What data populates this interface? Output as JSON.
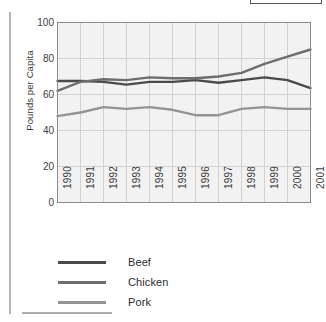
{
  "chart_data": {
    "type": "line",
    "title": "",
    "xlabel": "",
    "ylabel": "Pounds per Capita",
    "x": [
      "1990",
      "1991",
      "1992",
      "1993",
      "1994",
      "1995",
      "1996",
      "1997",
      "1998",
      "1999",
      "2000",
      "2001"
    ],
    "categories": [
      "1990",
      "1991",
      "1992",
      "1993",
      "1994",
      "1995",
      "1996",
      "1997",
      "1998",
      "1999",
      "2000",
      "2001"
    ],
    "ylim": [
      0,
      100
    ],
    "yticks": [
      0,
      20,
      40,
      60,
      80,
      100
    ],
    "ytick_labels": [
      "0",
      "20",
      "40",
      "60",
      "80",
      "100"
    ],
    "grid": true,
    "legend_position": "below",
    "series": [
      {
        "name": "Beef",
        "color": "#4a4a4a",
        "values": [
          67.5,
          67.5,
          67.0,
          65.5,
          67.0,
          67.0,
          68.0,
          66.5,
          68.0,
          69.5,
          68.0,
          63.5
        ]
      },
      {
        "name": "Chicken",
        "color": "#6e6e6e",
        "values": [
          62.0,
          67.0,
          68.5,
          68.0,
          69.5,
          69.0,
          69.0,
          70.0,
          72.0,
          77.0,
          81.0,
          85.0
        ]
      },
      {
        "name": "Pork",
        "color": "#949494",
        "values": [
          48.0,
          50.0,
          53.0,
          52.0,
          53.0,
          51.5,
          48.5,
          48.5,
          52.0,
          53.0,
          52.0,
          52.0
        ]
      }
    ]
  },
  "legend": {
    "items": [
      {
        "label": "Beef"
      },
      {
        "label": "Chicken"
      },
      {
        "label": "Pork"
      }
    ]
  },
  "axes": {
    "y_title": "Pounds per Capita"
  },
  "colors": {
    "beef": "#4a4a4a",
    "chicken": "#6e6e6e",
    "pork": "#949494",
    "plot_background": "#f2f2f2",
    "gridline": "#d2d2d2",
    "axis": "#8c8c8c"
  }
}
